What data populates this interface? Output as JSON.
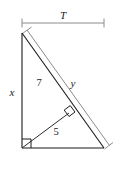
{
  "figure": {
    "kind": "geometry-diagram",
    "background_color": "#ffffff",
    "colors": {
      "triangle_stroke": "#1a1a1a",
      "inner_segment_stroke": "#2b2b2b",
      "dimension_stroke": "#8c8c8c",
      "label_color": "#1a1a1a"
    },
    "labels": {
      "top_dimension": "T",
      "vertical_leg": "x",
      "hypotenuse_upper": "7",
      "hypotenuse_offset": "y",
      "inner_segment": "5"
    },
    "markers": {
      "right_angle_corner": "right-angle-square",
      "right_angle_foot": "right-angle-square"
    },
    "geometry": {
      "apex": [
        22,
        33
      ],
      "bottom_left": [
        22,
        148
      ],
      "bottom_right": [
        104,
        148
      ],
      "foot_on_hypotenuse": [
        69,
        113
      ],
      "top_dimension_y": 23,
      "top_dimension_x1": 22,
      "top_dimension_x2": 104,
      "offset_line_start": [
        27,
        30
      ],
      "offset_line_end": [
        109,
        145
      ]
    }
  }
}
